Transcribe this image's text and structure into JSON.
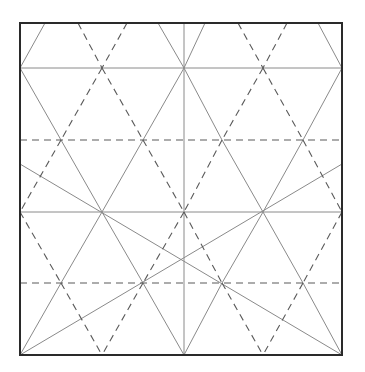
{
  "diagram": {
    "type": "crease-pattern",
    "width": 365,
    "height": 372,
    "colors": {
      "background": "#ffffff",
      "border": "#2a2a2a",
      "mountain": "#8a8a8a",
      "valley": "#5a5a5a"
    },
    "border": {
      "x1": 20,
      "y1": 23,
      "x2": 342,
      "y2": 355
    },
    "solid_lines": [
      [
        20,
        68,
        342,
        68
      ],
      [
        20,
        212,
        342,
        212
      ],
      [
        184,
        23,
        184,
        355
      ],
      [
        45,
        23,
        20,
        68
      ],
      [
        158,
        23,
        184,
        68
      ],
      [
        205,
        23,
        184,
        68
      ],
      [
        318,
        23,
        342,
        68
      ],
      [
        20,
        68,
        61,
        140
      ],
      [
        184,
        68,
        143,
        140
      ],
      [
        184,
        68,
        222,
        140
      ],
      [
        342,
        68,
        303,
        140
      ],
      [
        61,
        140,
        102,
        212
      ],
      [
        143,
        140,
        102,
        212
      ],
      [
        222,
        140,
        263,
        212
      ],
      [
        303,
        140,
        263,
        212
      ],
      [
        102,
        212,
        61,
        283
      ],
      [
        102,
        212,
        143,
        283
      ],
      [
        263,
        212,
        222,
        283
      ],
      [
        263,
        212,
        303,
        283
      ],
      [
        61,
        283,
        20,
        355
      ],
      [
        143,
        283,
        184,
        355
      ],
      [
        222,
        283,
        184,
        355
      ],
      [
        303,
        283,
        342,
        355
      ],
      [
        20,
        164,
        342,
        355
      ],
      [
        342,
        164,
        20,
        355
      ]
    ],
    "dashed_lines": [
      [
        20,
        140,
        342,
        140
      ],
      [
        20,
        283,
        342,
        283
      ],
      [
        78,
        23,
        102,
        68
      ],
      [
        127,
        23,
        102,
        68
      ],
      [
        238,
        23,
        263,
        68
      ],
      [
        287,
        23,
        263,
        68
      ],
      [
        102,
        68,
        61,
        140
      ],
      [
        102,
        68,
        143,
        140
      ],
      [
        263,
        68,
        222,
        140
      ],
      [
        263,
        68,
        303,
        140
      ],
      [
        61,
        140,
        20,
        212
      ],
      [
        143,
        140,
        184,
        212
      ],
      [
        222,
        140,
        184,
        212
      ],
      [
        303,
        140,
        342,
        212
      ],
      [
        20,
        212,
        61,
        283
      ],
      [
        184,
        212,
        143,
        283
      ],
      [
        184,
        212,
        222,
        283
      ],
      [
        342,
        212,
        303,
        283
      ],
      [
        61,
        283,
        102,
        355
      ],
      [
        143,
        283,
        102,
        355
      ],
      [
        222,
        283,
        263,
        355
      ],
      [
        303,
        283,
        263,
        355
      ]
    ]
  }
}
